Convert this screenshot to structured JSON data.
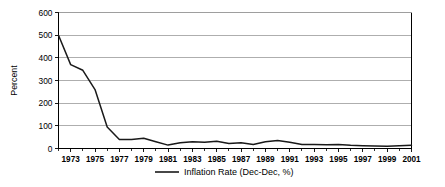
{
  "chart_data": {
    "type": "line",
    "title": "",
    "subtitle": "",
    "xlabel": "",
    "ylabel": "Percent",
    "ylim": [
      0,
      600
    ],
    "xlim": [
      1972,
      2001
    ],
    "yticks": [
      0,
      100,
      200,
      300,
      400,
      500,
      600
    ],
    "ytick_labels": [
      "0",
      "100",
      "200",
      "300",
      "400",
      "500",
      "600"
    ],
    "xticks": [
      1973,
      1975,
      1977,
      1979,
      1981,
      1983,
      1985,
      1987,
      1989,
      1991,
      1993,
      1995,
      1997,
      1999,
      2001
    ],
    "xtick_labels": [
      "1973",
      "1975",
      "1977",
      "1979",
      "1981",
      "1983",
      "1985",
      "1987",
      "1989",
      "1991",
      "1993",
      "1995",
      "1997",
      "1999",
      "2001"
    ],
    "x_minor_step": 1,
    "grid": "horizontal",
    "legend_position": "bottom",
    "series": [
      {
        "name": "Inflation Rate (Dec-Dec, %)",
        "color": "#1a1a1a",
        "x": [
          1972,
          1973,
          1974,
          1975,
          1976,
          1977,
          1978,
          1979,
          1980,
          1981,
          1982,
          1983,
          1984,
          1985,
          1986,
          1987,
          1988,
          1989,
          1990,
          1991,
          1992,
          1993,
          1994,
          1995,
          1996,
          1997,
          1998,
          1999,
          2000,
          2001
        ],
        "values": [
          500,
          370,
          345,
          260,
          95,
          40,
          40,
          45,
          30,
          15,
          25,
          30,
          28,
          32,
          22,
          25,
          18,
          30,
          35,
          28,
          18,
          18,
          17,
          18,
          14,
          12,
          11,
          10,
          12,
          14
        ]
      }
    ]
  },
  "legend": {
    "entries": [
      {
        "label": "Inflation Rate (Dec-Dec, %)",
        "color": "#1a1a1a"
      }
    ]
  },
  "axes": {
    "y_title": "Percent"
  },
  "colors": {
    "series": "#1a1a1a",
    "grid": "#9a9a9a",
    "axis": "#000000",
    "background": "#ffffff"
  }
}
